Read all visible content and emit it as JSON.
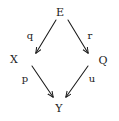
{
  "diagram": {
    "type": "commutative-diagram",
    "background_color": "#ffffff",
    "ink_color": "#1a1a1a",
    "nodes": [
      {
        "id": "E",
        "label": "E",
        "x": 60,
        "y": 12
      },
      {
        "id": "X",
        "label": "X",
        "x": 14,
        "y": 59
      },
      {
        "id": "Q",
        "label": "Q",
        "x": 103,
        "y": 60
      },
      {
        "id": "Y",
        "label": "Y",
        "x": 59,
        "y": 108
      }
    ],
    "edges": [
      {
        "id": "E-to-X",
        "label": "q",
        "from": "E",
        "to": "X",
        "label_x": 30,
        "label_y": 36,
        "x1": 56,
        "y1": 20,
        "x2": 36,
        "y2": 53
      },
      {
        "id": "E-to-Q",
        "label": "r",
        "from": "E",
        "to": "Q",
        "label_x": 90,
        "label_y": 36,
        "x1": 68,
        "y1": 20,
        "x2": 88,
        "y2": 53
      },
      {
        "id": "X-to-Y",
        "label": "p",
        "from": "X",
        "to": "Y",
        "label_x": 25,
        "label_y": 79,
        "x1": 32,
        "y1": 66,
        "x2": 53,
        "y2": 97
      },
      {
        "id": "Q-to-Y",
        "label": "u",
        "from": "Q",
        "to": "Y",
        "label_x": 92,
        "label_y": 79,
        "x1": 88,
        "y1": 66,
        "x2": 66,
        "y2": 97
      }
    ]
  }
}
